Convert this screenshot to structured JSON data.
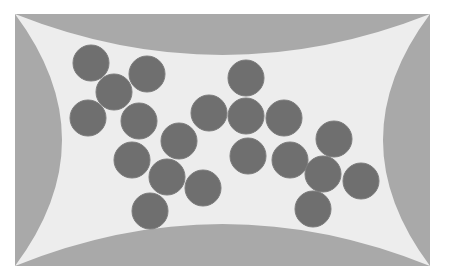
{
  "diagram": {
    "colors": {
      "background": "#ffffff",
      "frame_fill": "#a9a9a9",
      "inner_fill": "#ededed",
      "particle_fill": "#6f6f6f",
      "particle_edge": "#7c7c7c"
    },
    "frame": {
      "x": 15,
      "y": 14,
      "width": 415,
      "height": 252
    },
    "arcs": {
      "top_depth_y": 55,
      "bottom_depth_y": 224,
      "left_depth_x": 62,
      "right_depth_x": 383
    },
    "particle_radius": 18,
    "particles": [
      {
        "cx": 91,
        "cy": 63
      },
      {
        "cx": 147,
        "cy": 74
      },
      {
        "cx": 114,
        "cy": 92
      },
      {
        "cx": 88,
        "cy": 118
      },
      {
        "cx": 139,
        "cy": 121
      },
      {
        "cx": 246,
        "cy": 78
      },
      {
        "cx": 209,
        "cy": 113
      },
      {
        "cx": 246,
        "cy": 116
      },
      {
        "cx": 284,
        "cy": 118
      },
      {
        "cx": 179,
        "cy": 141
      },
      {
        "cx": 132,
        "cy": 160
      },
      {
        "cx": 167,
        "cy": 177
      },
      {
        "cx": 203,
        "cy": 188
      },
      {
        "cx": 150,
        "cy": 211
      },
      {
        "cx": 248,
        "cy": 156
      },
      {
        "cx": 290,
        "cy": 160
      },
      {
        "cx": 334,
        "cy": 139
      },
      {
        "cx": 323,
        "cy": 174
      },
      {
        "cx": 361,
        "cy": 181
      },
      {
        "cx": 313,
        "cy": 209
      }
    ]
  }
}
